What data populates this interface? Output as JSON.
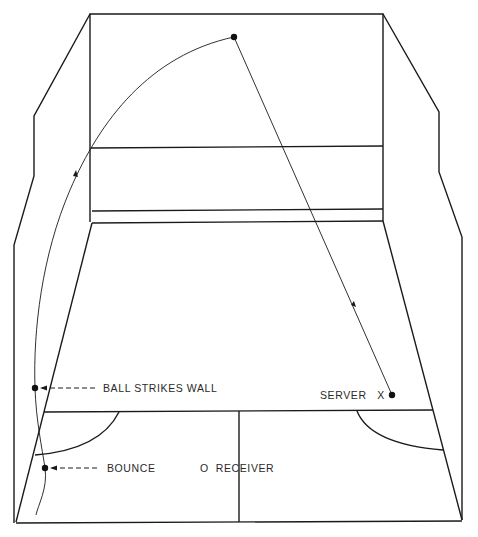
{
  "diagram": {
    "colors": {
      "line": "#1a1a1a",
      "background": "#ffffff",
      "text": "#2a2a2a"
    },
    "labels": {
      "ball_strikes_wall": "BALL STRIKES WALL",
      "bounce": "BOUNCE",
      "receiver": "O  RECEIVER",
      "server": "SERVER   X"
    },
    "markers": {
      "serve_point": {
        "x": 392,
        "y": 395
      },
      "front_wall_hit": {
        "x": 234,
        "y": 37
      },
      "side_wall_hit": {
        "x": 35,
        "y": 388
      },
      "bounce_point": {
        "x": 45,
        "y": 468
      }
    }
  }
}
